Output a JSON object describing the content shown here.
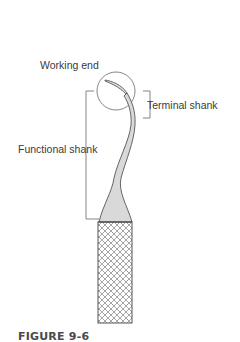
{
  "figure": {
    "caption": "FIGURE 9-6",
    "labels": {
      "working_end": "Working end",
      "terminal_shank": "Terminal shank",
      "functional_shank": "Functional shank"
    },
    "colors": {
      "line": "#555555",
      "shank_fill": "#d9d9d9",
      "handle_pattern": "#6a6a6a",
      "text": "#3a3a3a",
      "caption": "#4a4a4a"
    }
  }
}
